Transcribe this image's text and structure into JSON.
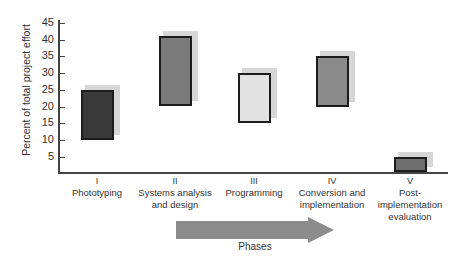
{
  "chart_data": {
    "type": "bar",
    "subtype": "floating-range",
    "title": "",
    "xlabel": "Phases",
    "ylabel": "Percent of total project effort",
    "ylim": [
      0,
      45
    ],
    "yticks": [
      5,
      10,
      15,
      20,
      25,
      30,
      35,
      40,
      45
    ],
    "grid": false,
    "legend": null,
    "categories": [
      {
        "roman": "I",
        "label": "Phototyping"
      },
      {
        "roman": "II",
        "label": "Systems analysis\nand design"
      },
      {
        "roman": "III",
        "label": "Programming"
      },
      {
        "roman": "IV",
        "label": "Conversion and\nimplementation"
      },
      {
        "roman": "V",
        "label": "Post-\nimplementation\nevaluation"
      }
    ],
    "series": [
      {
        "name": "Effort range",
        "low": [
          10,
          20,
          15,
          20,
          0
        ],
        "high": [
          25,
          41,
          30,
          35,
          5
        ]
      }
    ],
    "bar_colors": [
      "#3a3a3a",
      "#7a7a7a",
      "#e2e2e2",
      "#8a8a8a",
      "#6e6e6e"
    ],
    "annotation": {
      "type": "arrow",
      "label": "Phases",
      "color": "#8c8c8c"
    }
  }
}
